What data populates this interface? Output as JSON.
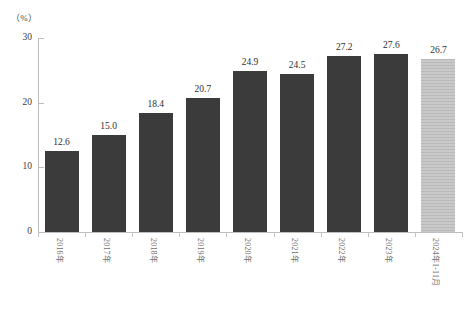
{
  "chart_data": {
    "type": "bar",
    "title": "",
    "subtitle": "",
    "xlabel": "",
    "ylabel": "",
    "unit_label": "（%）",
    "ylim": [
      0,
      30
    ],
    "yticks": [
      0,
      10,
      20,
      30
    ],
    "ytick_labels": [
      "0",
      "10",
      "20",
      "30"
    ],
    "grid": false,
    "legend": "none",
    "categories": [
      "2016年",
      "2017年",
      "2018年",
      "2019年",
      "2020年",
      "2021年",
      "2022年",
      "2023年",
      "2024年1-11月"
    ],
    "values": [
      12.6,
      15.0,
      18.4,
      20.7,
      24.9,
      24.5,
      27.2,
      27.6,
      26.7
    ],
    "value_labels": [
      "12.6",
      "15.0",
      "18.4",
      "20.7",
      "24.9",
      "24.5",
      "27.2",
      "27.6",
      "26.7"
    ],
    "highlight_index": 8,
    "colors": {
      "bar": "#3b3b3b",
      "bar_highlight": "#bfbfbf",
      "axis": "#bdbdbd",
      "text": "#2e2e2e",
      "tick_text": "#3d3d3d",
      "category_text": "#6f6f6f",
      "background": "#ffffff"
    }
  }
}
